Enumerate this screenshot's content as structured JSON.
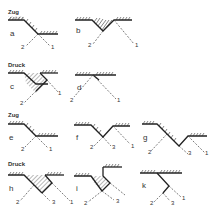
{
  "sections": [
    {
      "label": "Zug",
      "row": 1
    },
    {
      "label": "Druck",
      "row": 2
    },
    {
      "label": "Zug",
      "row": 3
    },
    {
      "label": "Druck",
      "row": 4
    }
  ],
  "figures": [
    {
      "id": "a",
      "label": "a",
      "lines": [
        "2",
        "1"
      ]
    },
    {
      "id": "b",
      "label": "b",
      "lines": [
        "2",
        "1"
      ]
    },
    {
      "id": "c",
      "label": "c",
      "lines": [
        "2",
        "1"
      ]
    },
    {
      "id": "d",
      "label": "d",
      "lines": [
        "2",
        "1"
      ]
    },
    {
      "id": "e",
      "label": "e",
      "lines": [
        "2",
        "1"
      ]
    },
    {
      "id": "f",
      "label": "f",
      "lines": [
        "2",
        "3",
        "1"
      ]
    },
    {
      "id": "g",
      "label": "g",
      "lines": [
        "2",
        "3",
        "1"
      ]
    },
    {
      "id": "h",
      "label": "h",
      "lines": [
        "2",
        "3",
        "1"
      ]
    },
    {
      "id": "i",
      "label": "i",
      "lines": [
        "2",
        "3"
      ]
    },
    {
      "id": "k",
      "label": "k",
      "lines": [
        "2",
        "3",
        "1"
      ]
    }
  ],
  "colors": {
    "line": "#222222",
    "background": "#ffffff"
  }
}
